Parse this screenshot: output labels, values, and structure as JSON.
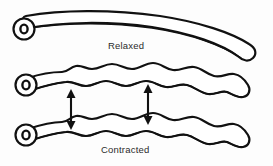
{
  "figure": {
    "background_color": "#fdfdfd",
    "stroke_color": "#111111",
    "fill_color": "#ffffff",
    "width": 273,
    "height": 166
  },
  "labels": {
    "relaxed": "Relaxed",
    "contracted": "Contracted"
  },
  "elements": {
    "relaxed_tube_name": "relaxed-muscle-fiber",
    "contracted_tube_upper_name": "contracted-muscle-fiber-upper",
    "contracted_tube_lower_name": "contracted-muscle-fiber-lower",
    "lumen_name": "fiber-cross-section-lumen",
    "arrow_left_name": "contraction-arrow-left",
    "arrow_right_name": "contraction-arrow-right"
  },
  "annotations": {
    "arrow_count": 2,
    "arrow_type": "double-headed-vertical",
    "arrow_meaning": "shortening distance between contracted fibers"
  }
}
